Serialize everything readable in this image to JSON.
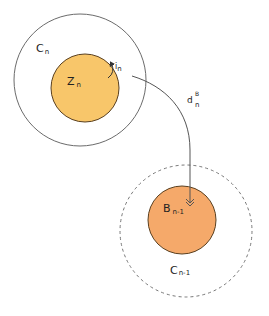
{
  "diagram": {
    "colors": {
      "background": "#ffffff",
      "outline": "#6b6b6b",
      "ball_outline": "#5a4020",
      "z_fill": "#f8c66a",
      "b_fill": "#f5a96a",
      "arrow": "#555555"
    },
    "nodes": [
      {
        "id": "C_n",
        "base": "C",
        "subscript": "n",
        "shape": "circle",
        "style": "solid",
        "fill": "none"
      },
      {
        "id": "Z_n",
        "base": "Z",
        "subscript": "n",
        "shape": "circle",
        "style": "solid",
        "fill": "#f8c66a"
      },
      {
        "id": "C_n-1",
        "base": "C",
        "subscript": "n-1",
        "shape": "circle",
        "style": "dashed",
        "fill": "none"
      },
      {
        "id": "B_n-1",
        "base": "B",
        "subscript": "n-1",
        "shape": "circle",
        "style": "solid",
        "fill": "#f5a96a"
      }
    ],
    "edges": [
      {
        "id": "i_n",
        "from": "Z_n",
        "to": "C_n",
        "label_base": "i",
        "label_subscript": "n",
        "style": "small curved arrow (inclusion)"
      },
      {
        "id": "d_n^B",
        "from": "Z_n",
        "to": "B_n-1",
        "label_base": "d",
        "label_subscript": "n",
        "label_superscript": "B",
        "style": "curved arrow"
      }
    ],
    "labels": {
      "c_n": {
        "base": "C",
        "sub": "n"
      },
      "z_n": {
        "base": "Z",
        "sub": "n"
      },
      "i_n": {
        "base": "i",
        "sub": "n"
      },
      "d_n_B": {
        "base": "d",
        "sub": "n",
        "sup": "B"
      },
      "b_n1": {
        "base": "B",
        "sub": "n-1"
      },
      "c_n1": {
        "base": "C",
        "sub": "n-1"
      }
    }
  }
}
